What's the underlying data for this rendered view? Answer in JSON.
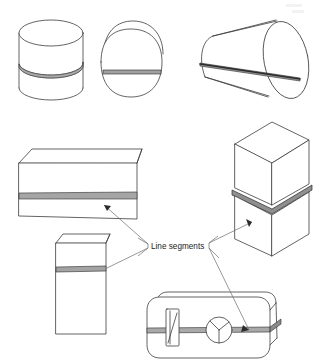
{
  "figure": {
    "background_color": "#ffffff",
    "line_color": "#3c3c3c",
    "cut_color": "#9a9a9a",
    "annotation": {
      "label": "Line segments",
      "label_x": 151,
      "label_y": 246
    }
  },
  "shapes": [
    {
      "id": "cylinder-upright",
      "name": "upright-cylinder",
      "type": "cylinder",
      "orientation": "vertical",
      "cut_type": "elliptical-arc",
      "position": {
        "x": 18,
        "y": 12,
        "w": 66,
        "h": 93
      }
    },
    {
      "id": "cylinder-end-on",
      "name": "end-on-cylinder",
      "type": "cylinder",
      "orientation": "axial-view",
      "cut_type": "horizontal-band",
      "position": {
        "x": 100,
        "y": 20,
        "w": 64,
        "h": 80
      }
    },
    {
      "id": "cylinder-horizontal",
      "name": "horizontal-cylinder",
      "type": "cylinder",
      "orientation": "oblique",
      "cut_type": "longitudinal-line",
      "position": {
        "x": 198,
        "y": 12,
        "w": 112,
        "h": 92
      }
    },
    {
      "id": "box-wide",
      "name": "wide-flat-box",
      "type": "box",
      "orientation": "horizontal",
      "cut_type": "horizontal-band",
      "position": {
        "x": 18,
        "y": 148,
        "w": 125,
        "h": 75
      }
    },
    {
      "id": "box-tall-stacked",
      "name": "stacked-vertical-box",
      "type": "box",
      "orientation": "vertical",
      "cut_type": "v-shaped-band",
      "position": {
        "x": 228,
        "y": 120,
        "w": 82,
        "h": 120
      }
    },
    {
      "id": "box-tall-narrow",
      "name": "tall-narrow-box",
      "type": "box",
      "orientation": "vertical",
      "cut_type": "horizontal-band",
      "position": {
        "x": 55,
        "y": 232,
        "w": 58,
        "h": 100
      }
    },
    {
      "id": "prism-rounded",
      "name": "rounded-prism-with-features",
      "type": "rounded-box",
      "orientation": "horizontal",
      "cut_type": "horizontal-band",
      "features": [
        "rectangular-slot",
        "circular-boss-with-spokes"
      ],
      "position": {
        "x": 146,
        "y": 288,
        "w": 128,
        "h": 74
      }
    }
  ],
  "leaders": [
    {
      "id": "leader-wide-box",
      "target": "box-wide"
    },
    {
      "id": "leader-narrow-box",
      "target": "box-tall-narrow"
    },
    {
      "id": "leader-stacked-box",
      "target": "box-tall-stacked"
    },
    {
      "id": "leader-rounded-prism",
      "target": "prism-rounded"
    }
  ]
}
